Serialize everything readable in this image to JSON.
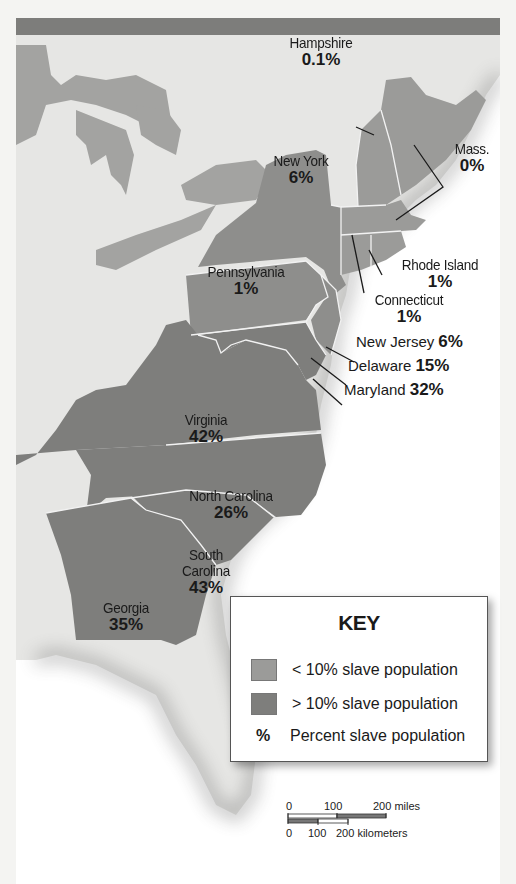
{
  "map": {
    "colors": {
      "low_slave_fill": "#9b9b99",
      "high_slave_fill": "#7e7e7c",
      "land_background": "#e6e6e4",
      "water": "#ffffff",
      "title_bar": "#7d7d7b",
      "border": "#f2f2f2"
    },
    "states": [
      {
        "name": "New Hampshire",
        "percent": "0.1%",
        "category": "low"
      },
      {
        "name": "Mass.",
        "percent": "0%",
        "category": "low"
      },
      {
        "name": "New York",
        "percent": "6%",
        "category": "low"
      },
      {
        "name": "Rhode Island",
        "percent": "1%",
        "category": "low"
      },
      {
        "name": "Pennsylvania",
        "percent": "1%",
        "category": "low"
      },
      {
        "name": "Connecticut",
        "percent": "1%",
        "category": "low"
      },
      {
        "name": "New Jersey",
        "percent": "6%",
        "category": "low"
      },
      {
        "name": "Delaware",
        "percent": "15%",
        "category": "high"
      },
      {
        "name": "Maryland",
        "percent": "32%",
        "category": "high"
      },
      {
        "name": "Virginia",
        "percent": "42%",
        "category": "high"
      },
      {
        "name": "North Carolina",
        "percent": "26%",
        "category": "high"
      },
      {
        "name": "South Carolina",
        "percent": "43%",
        "category": "high"
      },
      {
        "name": "Georgia",
        "percent": "35%",
        "category": "high"
      }
    ],
    "south_carolina_line1": "South",
    "south_carolina_line2": "Carolina",
    "new_hampshire_line1": "New",
    "new_hampshire_line2": "Hampshire"
  },
  "key": {
    "title": "KEY",
    "items": [
      {
        "symbol": "swatch-light",
        "label": "< 10% slave population"
      },
      {
        "symbol": "swatch-dark",
        "label": "> 10% slave population"
      },
      {
        "symbol": "%",
        "label": "Percent slave population"
      }
    ]
  },
  "scale_bar": {
    "miles_ticks": [
      "0",
      "100",
      "200 miles"
    ],
    "km_ticks": [
      "0",
      "100",
      "200 kilometers"
    ]
  }
}
